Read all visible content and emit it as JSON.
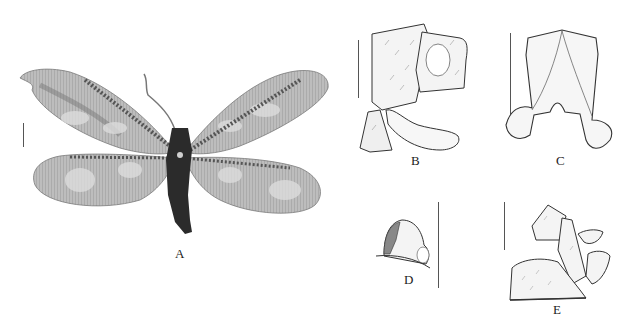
{
  "figure": {
    "panels": [
      {
        "id": "A",
        "label": "A",
        "content": "habitus photograph, dorsal view, wings spread"
      },
      {
        "id": "B",
        "label": "B",
        "content": "male terminalia, lateral view"
      },
      {
        "id": "C",
        "label": "C",
        "content": "male genital structure, dorsal view"
      },
      {
        "id": "D",
        "label": "D",
        "content": "female terminalia detail, lateral view"
      },
      {
        "id": "E",
        "label": "E",
        "content": "female terminalia, lateral view"
      }
    ],
    "colors": {
      "background": "#ffffff",
      "wing_fill": "#b9b9b9",
      "wing_dark": "#6e6e6e",
      "wing_light": "#d8d8d8",
      "body": "#2b2b2b",
      "ink": "#333333"
    }
  }
}
